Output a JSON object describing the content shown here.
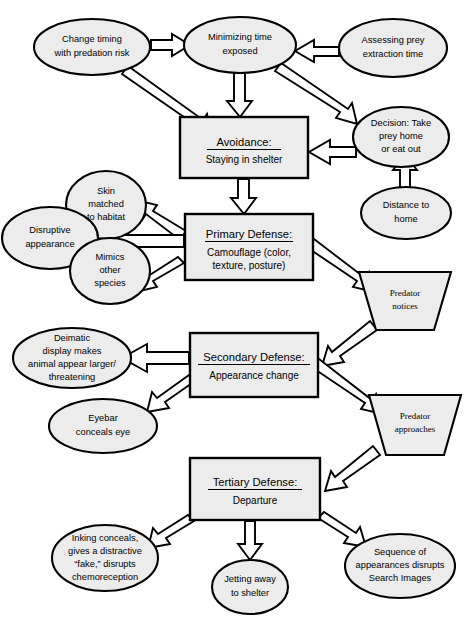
{
  "diagram": {
    "style": {
      "shape_fill": "#ececec",
      "stroke": "#000000",
      "arrow_fill": "#ffffff",
      "background": "#ffffff"
    },
    "ellipses": [
      {
        "id": "change-timing",
        "lines": [
          "Change timing",
          "with predation risk"
        ],
        "cx": 92,
        "cy": 47,
        "rx": 58,
        "ry": 28
      },
      {
        "id": "minimizing-time",
        "lines": [
          "Minimizing time",
          "exposed"
        ],
        "cx": 240,
        "cy": 45,
        "rx": 56,
        "ry": 28
      },
      {
        "id": "assessing-prey",
        "lines": [
          "Assessing prey",
          "extraction time"
        ],
        "cx": 393,
        "cy": 48,
        "rx": 54,
        "ry": 29
      },
      {
        "id": "decision-take-prey",
        "lines": [
          "Decision: Take",
          "prey home",
          "or eat out"
        ],
        "cx": 401,
        "cy": 137,
        "rx": 48,
        "ry": 30
      },
      {
        "id": "distance-to-home",
        "lines": [
          "Distance to",
          "home"
        ],
        "cx": 406,
        "cy": 213,
        "rx": 45,
        "ry": 26
      },
      {
        "id": "skin-matched",
        "lines": [
          "Skin",
          "matched",
          "to habitat"
        ],
        "cx": 106,
        "cy": 205,
        "rx": 40,
        "ry": 34
      },
      {
        "id": "disruptive-appearance",
        "lines": [
          "Disruptive",
          "appearance"
        ],
        "cx": 50,
        "cy": 238,
        "rx": 48,
        "ry": 31
      },
      {
        "id": "mimics-other-species",
        "lines": [
          "Mimics",
          "other",
          "species"
        ],
        "cx": 110,
        "cy": 271,
        "rx": 40,
        "ry": 33
      },
      {
        "id": "deimatic-display",
        "lines": [
          "Deimatic",
          "display makes",
          "animal appear larger/",
          "threatening"
        ],
        "cx": 72,
        "cy": 358,
        "rx": 59,
        "ry": 30
      },
      {
        "id": "eyebar-conceals-eye",
        "lines": [
          "Eyebar",
          "conceals eye"
        ],
        "cx": 103,
        "cy": 426,
        "rx": 54,
        "ry": 27
      },
      {
        "id": "inking-conceals",
        "lines": [
          "Inking conceals,",
          "gives a distractive",
          "“fake,” disrupts",
          "chemoreception"
        ],
        "cx": 105,
        "cy": 558,
        "rx": 53,
        "ry": 33
      },
      {
        "id": "jetting-away",
        "lines": [
          "Jetting away",
          "to shelter"
        ],
        "cx": 250,
        "cy": 587,
        "rx": 38,
        "ry": 27
      },
      {
        "id": "sequence-of-appearances",
        "lines": [
          "Sequence of",
          "appearances disrupts",
          "Search Images"
        ],
        "cx": 400,
        "cy": 566,
        "rx": 55,
        "ry": 32
      }
    ],
    "boxes": [
      {
        "id": "avoidance",
        "title": "Avoidance:",
        "sub": [
          "Staying in shelter"
        ],
        "x": 180,
        "y": 117,
        "w": 128,
        "h": 61
      },
      {
        "id": "primary-defense",
        "title": "Primary Defense:",
        "sub": [
          "Camouflage (color,",
          "texture, posture)"
        ],
        "x": 185,
        "y": 214,
        "w": 128,
        "h": 66
      },
      {
        "id": "secondary-defense",
        "title": "Secondary Defense:",
        "sub": [
          "Appearance change"
        ],
        "x": 190,
        "y": 333,
        "w": 128,
        "h": 64
      },
      {
        "id": "tertiary-defense",
        "title": "Tertiary Defense:",
        "sub": [
          "Departure"
        ],
        "x": 190,
        "y": 458,
        "w": 130,
        "h": 62
      }
    ],
    "trapezoids": [
      {
        "id": "predator-notices",
        "lines": [
          "Predator",
          "notices"
        ],
        "cx": 405,
        "cy": 301,
        "top_w": 92,
        "bottom_w": 58,
        "h": 58
      },
      {
        "id": "predator-approaches",
        "lines": [
          "Predator",
          "approaches"
        ],
        "cx": 415,
        "cy": 425,
        "top_w": 92,
        "bottom_w": 58,
        "h": 60
      }
    ],
    "edges": [
      {
        "id": "change-timing-to-minimizing",
        "from": "change-timing",
        "to": "minimizing-time"
      },
      {
        "id": "assessing-to-minimizing",
        "from": "assessing-prey",
        "to": "minimizing-time"
      },
      {
        "id": "change-timing-to-avoidance",
        "from": "change-timing",
        "to": "avoidance"
      },
      {
        "id": "minimizing-to-avoidance",
        "from": "minimizing-time",
        "to": "avoidance"
      },
      {
        "id": "minimizing-to-decision",
        "from": "minimizing-time",
        "to": "decision-take-prey"
      },
      {
        "id": "decision-to-avoidance",
        "from": "decision-take-prey",
        "to": "avoidance"
      },
      {
        "id": "distance-to-decision",
        "from": "distance-to-home",
        "to": "decision-take-prey"
      },
      {
        "id": "avoidance-to-primary",
        "from": "avoidance",
        "to": "primary-defense"
      },
      {
        "id": "primary-to-skin",
        "from": "primary-defense",
        "to": "skin-matched"
      },
      {
        "id": "primary-to-disruptive",
        "from": "primary-defense",
        "to": "disruptive-appearance"
      },
      {
        "id": "primary-to-mimics",
        "from": "primary-defense",
        "to": "mimics-other-species"
      },
      {
        "id": "primary-to-predator-notices",
        "from": "primary-defense",
        "to": "predator-notices"
      },
      {
        "id": "predator-notices-to-secondary",
        "from": "predator-notices",
        "to": "secondary-defense"
      },
      {
        "id": "secondary-to-deimatic",
        "from": "secondary-defense",
        "to": "deimatic-display"
      },
      {
        "id": "secondary-to-eyebar",
        "from": "secondary-defense",
        "to": "eyebar-conceals-eye"
      },
      {
        "id": "secondary-to-predator-approaches",
        "from": "secondary-defense",
        "to": "predator-approaches"
      },
      {
        "id": "predator-approaches-to-tertiary",
        "from": "predator-approaches",
        "to": "tertiary-defense"
      },
      {
        "id": "tertiary-to-inking",
        "from": "tertiary-defense",
        "to": "inking-conceals"
      },
      {
        "id": "tertiary-to-jetting",
        "from": "tertiary-defense",
        "to": "jetting-away"
      },
      {
        "id": "tertiary-to-sequence",
        "from": "tertiary-defense",
        "to": "sequence-of-appearances"
      }
    ]
  }
}
